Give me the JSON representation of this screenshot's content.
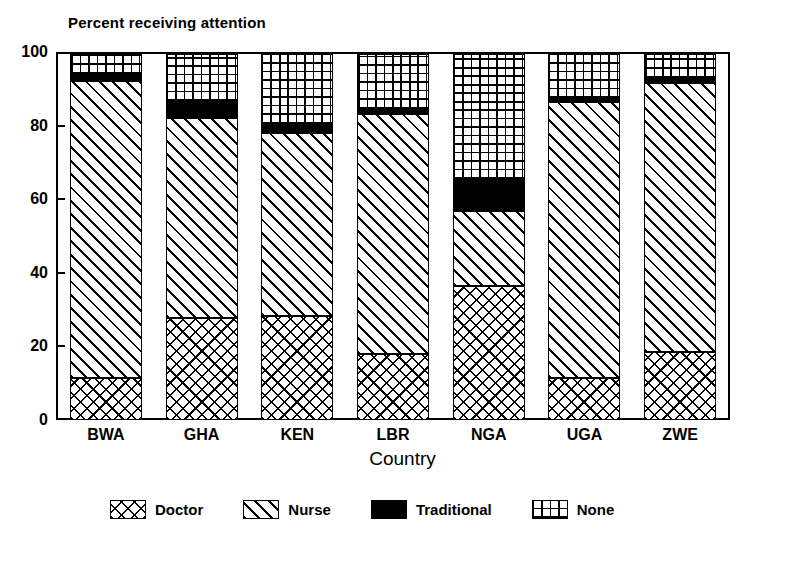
{
  "chart_data": {
    "type": "bar",
    "title": "Percent receiving attention",
    "subtitle": "",
    "xlabel": "Country",
    "ylabel": "",
    "stacked": true,
    "grid": false,
    "legend_position": "bottom",
    "ylim": [
      0,
      100
    ],
    "yticks": [
      0,
      20,
      40,
      60,
      80,
      100
    ],
    "ytick_labels": [
      "0",
      "20",
      "40",
      "60",
      "80",
      "100"
    ],
    "categories": [
      "BWA",
      "GHA",
      "KEN",
      "LBR",
      "NGA",
      "UGA",
      "ZWE"
    ],
    "series": [
      {
        "name": "Doctor",
        "pattern": "cross-hatch",
        "color": "#000000",
        "values": [
          11.5,
          28.0,
          28.5,
          18.0,
          36.5,
          11.5,
          18.5
        ]
      },
      {
        "name": "Nurse",
        "pattern": "diagonal-hatch",
        "color": "#000000",
        "values": [
          81.0,
          54.5,
          50.0,
          65.5,
          20.5,
          75.5,
          73.5
        ]
      },
      {
        "name": "Traditional",
        "pattern": "solid",
        "color": "#000000",
        "values": [
          2.0,
          4.5,
          2.5,
          1.5,
          8.5,
          0.8,
          1.5
        ]
      },
      {
        "name": "None",
        "pattern": "grid",
        "color": "#000000",
        "values": [
          5.5,
          13.0,
          19.0,
          15.0,
          34.5,
          12.2,
          6.5
        ]
      }
    ]
  },
  "legend": {
    "items": [
      {
        "label": "Doctor",
        "pattern": "cross-hatch"
      },
      {
        "label": "Nurse",
        "pattern": "diagonal-hatch"
      },
      {
        "label": "Traditional",
        "pattern": "solid"
      },
      {
        "label": "None",
        "pattern": "grid"
      }
    ]
  }
}
